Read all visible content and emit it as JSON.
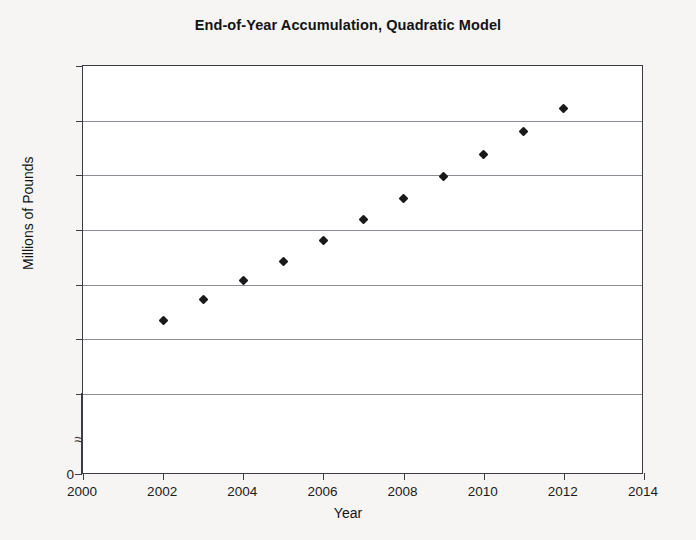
{
  "chart_data": {
    "type": "scatter",
    "title": "End-of-Year Accumulation, Quadratic Model",
    "xlabel": "Year",
    "ylabel": "Millions of Pounds",
    "x": [
      2002,
      2003,
      2004,
      2005,
      2006,
      2007,
      2008,
      2009,
      2010,
      2011,
      2012
    ],
    "values": [
      11.35,
      11.72,
      12.07,
      12.42,
      12.8,
      13.2,
      13.58,
      13.98,
      14.38,
      14.8,
      15.22
    ],
    "series": [
      {
        "name": "End-of-Year Accumulation",
        "values": [
          11.35,
          11.72,
          12.07,
          12.42,
          12.8,
          13.2,
          13.58,
          13.98,
          14.38,
          14.8,
          15.22
        ]
      }
    ],
    "xlim": [
      2000,
      2014
    ],
    "ylim": [
      0,
      16
    ],
    "y_axis_break": true,
    "y_axis_break_symbol": "≈",
    "y_visible_range": [
      10,
      16
    ],
    "xticks": [
      2000,
      2002,
      2004,
      2006,
      2008,
      2010,
      2012,
      2014
    ],
    "xtick_labels": [
      "2000",
      "2002",
      "2004",
      "2006",
      "2008",
      "2010",
      "2012",
      "2014"
    ],
    "yticks": [
      0,
      10,
      11,
      12,
      13,
      14,
      15,
      16
    ],
    "ytick_labels": [
      "0",
      "10",
      "11",
      "12",
      "13",
      "14",
      "15",
      "16"
    ],
    "gridlines": [
      10,
      11,
      12,
      13,
      14,
      15
    ],
    "grid": true,
    "legend": false,
    "marker": "diamond",
    "marker_color": "#1a1a1a",
    "plot_background": "#ffffff",
    "figure_background": "#f6f5f3",
    "axis_color": "#3c3c44",
    "gridline_color": "#8e8e96"
  }
}
